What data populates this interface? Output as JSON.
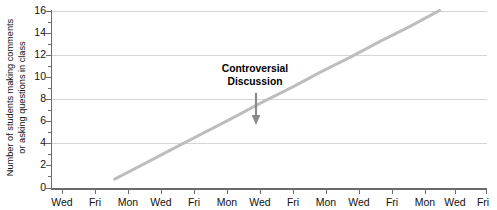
{
  "chart_data": {
    "type": "line",
    "title": "",
    "xlabel": "",
    "ylabel": "Number of students making comments\nor asking questions in class",
    "ylabel_line1": "Number of students making comments",
    "ylabel_line2": "or asking questions in class",
    "ylim": [
      0,
      16
    ],
    "ytick_labels": [
      "16",
      "14",
      "12",
      "10",
      "8",
      "6",
      "4",
      "2",
      "0"
    ],
    "ytick_values": [
      16,
      14,
      12,
      10,
      8,
      6,
      4,
      2,
      0
    ],
    "gridlines": [
      16,
      12,
      8,
      4
    ],
    "grid": true,
    "legend": "none",
    "x_tick_labels": [
      "Wed",
      "Fri",
      "Mon",
      "Wed",
      "Fri",
      "Mon",
      "Wed",
      "Fri",
      "Mon",
      "Wed",
      "Fri",
      "Mon",
      "Wed",
      "Fri"
    ],
    "x_index": [
      1,
      2,
      3,
      4,
      5,
      6,
      7,
      8,
      9,
      10,
      11,
      12,
      13,
      14
    ],
    "series": [
      {
        "name": "students participating",
        "color": "#bdbdbd",
        "points": [
          {
            "x_label": "Mon",
            "x_index": 3,
            "y": 0
          },
          {
            "x_label": "Wed",
            "x_index": 4,
            "y": 1.45
          },
          {
            "x_label": "Fri",
            "x_index": 5,
            "y": 2.9
          },
          {
            "x_label": "Mon",
            "x_index": 6,
            "y": 4.35
          },
          {
            "x_label": "Wed",
            "x_index": 7,
            "y": 5.8
          },
          {
            "x_label": "Fri",
            "x_index": 8,
            "y": 7.3
          },
          {
            "x_label": "Mon",
            "x_index": 9,
            "y": 8.7
          },
          {
            "x_label": "Wed",
            "x_index": 10,
            "y": 10.2
          },
          {
            "x_label": "Fri",
            "x_index": 11,
            "y": 11.6
          },
          {
            "x_label": "Mon",
            "x_index": 12,
            "y": 13.1
          },
          {
            "x_label": "Wed",
            "x_index": 13,
            "y": 14.5
          },
          {
            "x_label": "Fri",
            "x_index": 14,
            "y": 16
          }
        ]
      }
    ],
    "annotations": [
      {
        "text_line1": "Controversial",
        "text_line2": "Discussion",
        "at_x_label": "Wed",
        "at_x_index": 7,
        "arrow": "down",
        "arrow_target_y": 6
      }
    ]
  },
  "colors": {
    "line": "#bdbdbd",
    "grid": "#d6d6d6",
    "axis": "#6b6b6b",
    "text": "#111111",
    "arrow": "#8a8a8a"
  }
}
